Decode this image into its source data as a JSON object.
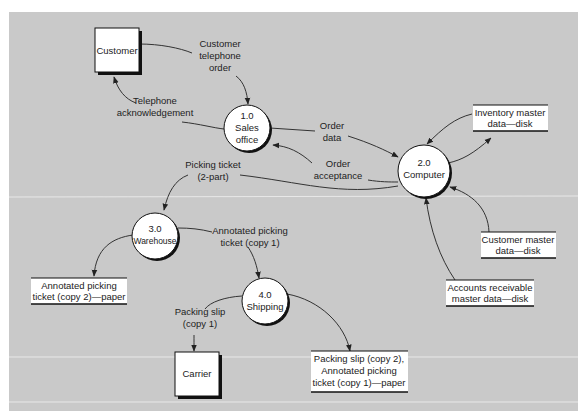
{
  "figure": {
    "type": "data-flow-diagram",
    "background": "#c8c8c8",
    "panel_color": "#c9c9c9",
    "separator_color": "#e6e6e6"
  },
  "entities": [
    {
      "id": "customer",
      "label": "Customer"
    },
    {
      "id": "carrier",
      "label": "Carrier"
    }
  ],
  "processes": [
    {
      "id": "p1",
      "number": "1.0",
      "name_lines": [
        "Sales",
        "office"
      ]
    },
    {
      "id": "p2",
      "number": "2.0",
      "name_lines": [
        "Computer"
      ]
    },
    {
      "id": "p3",
      "number": "3.0",
      "name_lines": [
        "Warehouse"
      ]
    },
    {
      "id": "p4",
      "number": "4.0",
      "name_lines": [
        "Shipping"
      ]
    }
  ],
  "stores": [
    {
      "id": "inventory",
      "lines": [
        "Inventory master",
        "data—disk"
      ]
    },
    {
      "id": "customer_master",
      "lines": [
        "Customer master",
        "data—disk"
      ]
    },
    {
      "id": "ar_master",
      "lines": [
        "Accounts receivable",
        "master data—disk"
      ]
    },
    {
      "id": "picking_copy2",
      "lines": [
        "Annotated picking",
        "ticket (copy 2)—paper"
      ]
    },
    {
      "id": "packing_copy2",
      "lines": [
        "Packing slip (copy 2),",
        "Annotated picking",
        "ticket (copy 1)—paper"
      ]
    }
  ],
  "flows": [
    {
      "id": "f1",
      "from": "Customer",
      "to": "1.0 Sales office",
      "lines": [
        "Customer",
        "telephone",
        "order"
      ]
    },
    {
      "id": "f2",
      "from": "1.0 Sales office",
      "to": "Customer",
      "lines": [
        "Telephone",
        "acknowledgement"
      ]
    },
    {
      "id": "f3",
      "from": "1.0 Sales office",
      "to": "2.0 Computer",
      "lines": [
        "Order",
        "data"
      ]
    },
    {
      "id": "f4",
      "from": "2.0 Computer",
      "to": "1.0 Sales office",
      "lines": [
        "Order",
        "acceptance"
      ]
    },
    {
      "id": "f5",
      "from": "2.0 Computer",
      "to": "3.0 Warehouse",
      "lines": [
        "Picking ticket",
        "(2-part)"
      ]
    },
    {
      "id": "f6",
      "from": "2.0 Computer",
      "to": "Inventory master data—disk",
      "lines": []
    },
    {
      "id": "f7",
      "from": "Inventory master data—disk",
      "to": "2.0 Computer",
      "lines": []
    },
    {
      "id": "f8",
      "from": "Customer master data—disk",
      "to": "2.0 Computer",
      "lines": []
    },
    {
      "id": "f9",
      "from": "Accounts receivable master data—disk",
      "to": "2.0 Computer",
      "lines": []
    },
    {
      "id": "f10",
      "from": "3.0 Warehouse",
      "to": "Annotated picking ticket (copy 2)—paper",
      "lines": []
    },
    {
      "id": "f11",
      "from": "3.0 Warehouse",
      "to": "4.0 Shipping",
      "lines": [
        "Annotated picking",
        "ticket (copy 1)"
      ]
    },
    {
      "id": "f12",
      "from": "4.0 Shipping",
      "to": "Carrier",
      "lines": [
        "Packing slip",
        "(copy 1)"
      ]
    },
    {
      "id": "f13",
      "from": "4.0 Shipping",
      "to": "Packing slip (copy 2), Annotated picking ticket (copy 1)—paper",
      "lines": []
    }
  ]
}
